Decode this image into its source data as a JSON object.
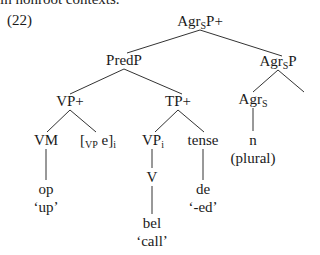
{
  "context_text": "in nonroot contexts.",
  "example_number": "(22)",
  "tree": {
    "root": {
      "base": "Agr",
      "sub": "S",
      "tail": "P+"
    },
    "predp": {
      "label": "PredP"
    },
    "agrsp": {
      "base": "Agr",
      "sub": "S",
      "tail": "P"
    },
    "vpplus": {
      "label": "VP+"
    },
    "tpplus": {
      "label": "TP+"
    },
    "agrs": {
      "base": "Agr",
      "sub": "S"
    },
    "vm": {
      "label": "VM"
    },
    "trace": {
      "open": "[",
      "sub": "VP",
      "mid": " e]",
      "index": "i"
    },
    "vpi": {
      "base": "VP",
      "index": "i"
    },
    "tense": {
      "label": "tense"
    },
    "n": {
      "label": "n"
    },
    "plural": {
      "label": "(plural)"
    },
    "op": {
      "label": "op"
    },
    "op_gloss": {
      "label": "‘up’"
    },
    "v": {
      "label": "V"
    },
    "de": {
      "label": "de"
    },
    "de_gloss": {
      "label": "‘-ed’"
    },
    "bel": {
      "label": "bel"
    },
    "bel_gloss": {
      "label": "‘call’"
    }
  }
}
